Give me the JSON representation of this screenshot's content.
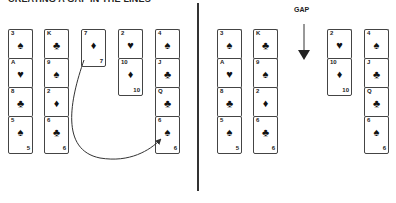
{
  "title": "CREATING A GAP IN THE LINES",
  "gap_label": "GAP",
  "colors": {
    "line": "#333333",
    "card_border": "#444444",
    "text": "#222222"
  },
  "before": {
    "columns": [
      {
        "cards": [
          {
            "rank": "3",
            "suit": "♠"
          },
          {
            "rank": "A",
            "suit": "♥"
          },
          {
            "rank": "8",
            "suit": "♣"
          },
          {
            "rank": "5",
            "suit": "♠"
          }
        ]
      },
      {
        "cards": [
          {
            "rank": "K",
            "suit": "♣"
          },
          {
            "rank": "9",
            "suit": "♠"
          },
          {
            "rank": "2",
            "suit": "♦"
          },
          {
            "rank": "6",
            "suit": "♣"
          }
        ]
      },
      {
        "cards": [
          {
            "rank": "7",
            "suit": "♦"
          }
        ]
      },
      {
        "cards": [
          {
            "rank": "2",
            "suit": "♥"
          },
          {
            "rank": "10",
            "suit": "♦"
          }
        ]
      },
      {
        "cards": [
          {
            "rank": "4",
            "suit": "♠"
          },
          {
            "rank": "J",
            "suit": "♣"
          },
          {
            "rank": "Q",
            "suit": "♣"
          },
          {
            "rank": "6",
            "suit": "♠"
          }
        ]
      }
    ]
  },
  "after": {
    "columns": [
      {
        "cards": [
          {
            "rank": "3",
            "suit": "♠"
          },
          {
            "rank": "A",
            "suit": "♥"
          },
          {
            "rank": "8",
            "suit": "♣"
          },
          {
            "rank": "5",
            "suit": "♠"
          }
        ]
      },
      {
        "cards": [
          {
            "rank": "K",
            "suit": "♣"
          },
          {
            "rank": "9",
            "suit": "♠"
          },
          {
            "rank": "2",
            "suit": "♦"
          },
          {
            "rank": "6",
            "suit": "♣"
          }
        ]
      },
      {
        "cards": []
      },
      {
        "cards": [
          {
            "rank": "2",
            "suit": "♥"
          },
          {
            "rank": "10",
            "suit": "♦"
          }
        ]
      },
      {
        "cards": [
          {
            "rank": "4",
            "suit": "♠"
          },
          {
            "rank": "J",
            "suit": "♣"
          },
          {
            "rank": "Q",
            "suit": "♣"
          },
          {
            "rank": "6",
            "suit": "♠"
          }
        ]
      }
    ]
  },
  "annotations": {
    "move_arrow": "7♦ moved onto 6♠",
    "gap_arrow": "GAP"
  }
}
